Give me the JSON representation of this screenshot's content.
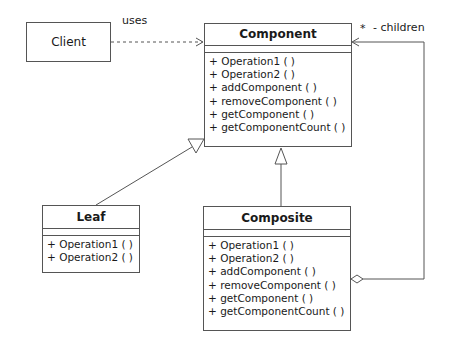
{
  "diagram": {
    "type": "UML class diagram",
    "classes": {
      "client": {
        "name": "Client"
      },
      "component": {
        "name": "Component",
        "operations": [
          "+ Operation1 ( )",
          "+ Operation2 ( )",
          "+ addComponent ( )",
          "+ removeComponent ( )",
          "+ getComponent ( )",
          "+ getComponentCount ( )"
        ]
      },
      "leaf": {
        "name": "Leaf",
        "operations": [
          "+ Operation1 ( )",
          "+ Operation2 ( )"
        ]
      },
      "composite": {
        "name": "Composite",
        "operations": [
          "+ Operation1 ( )",
          "+ Operation2 ( )",
          "+ addComponent ( )",
          "+ removeComponent ( )",
          "+ getComponent ( )",
          "+ getComponentCount ( )"
        ]
      }
    },
    "relations": {
      "uses": {
        "from": "Client",
        "to": "Component",
        "kind": "dependency",
        "label": "uses"
      },
      "leaf_generalization": {
        "from": "Leaf",
        "to": "Component",
        "kind": "generalization"
      },
      "composite_generalization": {
        "from": "Composite",
        "to": "Component",
        "kind": "generalization"
      },
      "children": {
        "from": "Composite",
        "to": "Component",
        "kind": "aggregation",
        "multiplicity": "*",
        "role": "- children"
      }
    },
    "colors": {
      "line": "#555555",
      "text": "#1a1a1a",
      "background": "#ffffff"
    }
  }
}
